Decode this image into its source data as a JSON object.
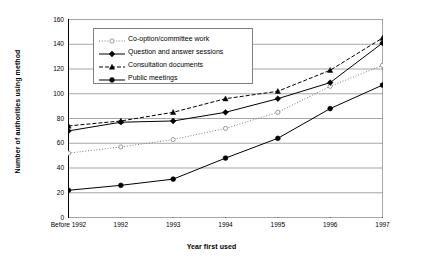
{
  "chart_data": {
    "type": "line",
    "title": "",
    "xlabel": "Year first used",
    "ylabel": "Number of authorities using method",
    "categories": [
      "Before 1992",
      "1992",
      "1993",
      "1994",
      "1995",
      "1996",
      "1997"
    ],
    "ylim": [
      0,
      160
    ],
    "ytick_step": 20,
    "yticks": [
      "0",
      "20",
      "40",
      "60",
      "80",
      "100",
      "120",
      "140",
      "160"
    ],
    "grid": "horizontal",
    "legend_position": "top-left-inside",
    "series": [
      {
        "name": "Co-option/committee work",
        "marker": "open-circle",
        "line_style": "dotted",
        "color": "#808080",
        "values": [
          52,
          57,
          63,
          72,
          85,
          106,
          123
        ]
      },
      {
        "name": "Question and answer sessions",
        "marker": "filled-diamond",
        "line_style": "solid",
        "color": "#000000",
        "values": [
          70,
          77,
          78,
          85,
          96,
          109,
          141
        ]
      },
      {
        "name": "Consultation documents",
        "marker": "filled-triangle",
        "line_style": "dashed",
        "color": "#000000",
        "values": [
          74,
          78,
          85,
          96,
          102,
          119,
          145
        ]
      },
      {
        "name": "Public meetings",
        "marker": "filled-circle",
        "line_style": "solid",
        "color": "#000000",
        "values": [
          22,
          26,
          31,
          48,
          64,
          88,
          107
        ]
      }
    ]
  },
  "axis": {
    "y_title": "Number of authorities using method",
    "x_title": "Year first used"
  },
  "colors": {
    "axis": "#000000",
    "gridline": "#808080",
    "legend_border": "#7f7f7f",
    "background": "#ffffff"
  }
}
